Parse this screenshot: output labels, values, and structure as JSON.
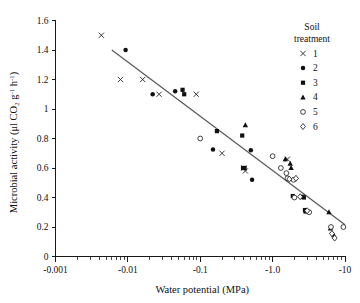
{
  "chart_data": {
    "type": "scatter",
    "title": "",
    "xlabel": "Water potential (MPa)",
    "ylabel": "Microbial activity (μl CO2 g-1 h-1)",
    "ylabel_parts": {
      "prefix": "Microbial activity (μl CO",
      "sub2": "2",
      "mid": " g",
      "sup1": "-1",
      "mid2": " h",
      "sup2": "-1",
      "suffix": ")"
    },
    "x_scale": "log-negative",
    "x_tick_labels": [
      "-0.001",
      "-0.01",
      "-0.1",
      "-1.0",
      "-10"
    ],
    "x_tick_values": [
      -0.001,
      -0.01,
      -0.1,
      -1.0,
      -10
    ],
    "xlim": [
      -0.001,
      -10
    ],
    "y_tick_labels": [
      "0",
      "0.2",
      "0.4",
      "0.6",
      "0.8",
      "1",
      "1.2",
      "1.4",
      "1.6"
    ],
    "y_tick_values": [
      0,
      0.2,
      0.4,
      0.6,
      0.8,
      1.0,
      1.2,
      1.4,
      1.6
    ],
    "ylim": [
      0,
      1.6
    ],
    "grid": false,
    "legend_position": "top-right",
    "legend_title_line1": "Soil",
    "legend_title_line2": "treatment",
    "trendline": {
      "x_start": -0.006,
      "y_start": 1.4,
      "x_end": -10.0,
      "y_end": 0.215,
      "color": "#5a5a5a"
    },
    "series": [
      {
        "name": "1",
        "label": "1",
        "marker": "cross",
        "color": "#303030",
        "points": [
          {
            "x": -0.0043,
            "y": 1.5
          },
          {
            "x": -0.0079,
            "y": 1.2
          },
          {
            "x": -0.016,
            "y": 1.2
          },
          {
            "x": -0.027,
            "y": 1.1
          },
          {
            "x": -0.088,
            "y": 1.1
          },
          {
            "x": -0.2,
            "y": 0.7
          },
          {
            "x": -0.4,
            "y": 0.6
          },
          {
            "x": -0.42,
            "y": 0.58
          },
          {
            "x": -1.6,
            "y": 0.66
          }
        ]
      },
      {
        "name": "2",
        "label": "2",
        "marker": "circle-filled",
        "color": "#101010",
        "points": [
          {
            "x": -0.0093,
            "y": 1.4
          },
          {
            "x": -0.022,
            "y": 1.1
          },
          {
            "x": -0.045,
            "y": 1.12
          },
          {
            "x": -0.15,
            "y": 0.725
          },
          {
            "x": -0.5,
            "y": 0.72
          },
          {
            "x": -0.52,
            "y": 0.52
          }
        ]
      },
      {
        "name": "3",
        "label": "3",
        "marker": "square-filled",
        "color": "#101010",
        "points": [
          {
            "x": -0.057,
            "y": 1.13
          },
          {
            "x": -0.06,
            "y": 1.1
          },
          {
            "x": -0.17,
            "y": 0.85
          },
          {
            "x": -0.38,
            "y": 0.82
          },
          {
            "x": -0.39,
            "y": 0.6
          },
          {
            "x": -0.41,
            "y": 0.6
          },
          {
            "x": -1.9,
            "y": 0.41
          },
          {
            "x": -2.7,
            "y": 0.4
          },
          {
            "x": -2.6,
            "y": 0.405
          },
          {
            "x": -2.8,
            "y": 0.315
          },
          {
            "x": -2.85,
            "y": 0.305
          }
        ]
      },
      {
        "name": "4",
        "label": "4",
        "marker": "triangle-filled",
        "color": "#101010",
        "points": [
          {
            "x": -0.42,
            "y": 0.89
          },
          {
            "x": -1.5,
            "y": 0.66
          },
          {
            "x": -1.75,
            "y": 0.63
          },
          {
            "x": -1.8,
            "y": 0.6
          },
          {
            "x": -6.0,
            "y": 0.3
          },
          {
            "x": -6.3,
            "y": 0.19
          },
          {
            "x": -7.0,
            "y": 0.145
          }
        ]
      },
      {
        "name": "5",
        "label": "5",
        "marker": "circle-open",
        "color": "#202020",
        "points": [
          {
            "x": -0.1,
            "y": 0.8
          },
          {
            "x": -1.0,
            "y": 0.68
          },
          {
            "x": -1.3,
            "y": 0.6
          },
          {
            "x": -1.55,
            "y": 0.565
          },
          {
            "x": -1.6,
            "y": 0.53
          },
          {
            "x": -1.95,
            "y": 0.52
          },
          {
            "x": -2.0,
            "y": 0.4
          },
          {
            "x": -3.2,
            "y": 0.3
          },
          {
            "x": -6.4,
            "y": 0.2
          },
          {
            "x": -9.5,
            "y": 0.2
          }
        ]
      },
      {
        "name": "6",
        "label": "6",
        "marker": "diamond-open",
        "color": "#202020",
        "points": [
          {
            "x": -1.7,
            "y": 0.525
          },
          {
            "x": -2.1,
            "y": 0.53
          },
          {
            "x": -2.4,
            "y": 0.405
          },
          {
            "x": -3.0,
            "y": 0.31
          },
          {
            "x": -6.6,
            "y": 0.155
          },
          {
            "x": -7.2,
            "y": 0.125
          }
        ]
      }
    ]
  }
}
